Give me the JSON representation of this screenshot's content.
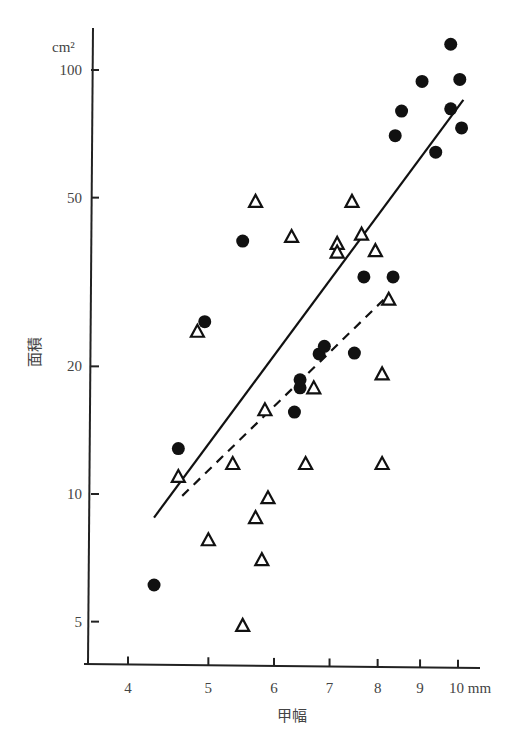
{
  "chart_data": {
    "type": "scatter",
    "title": "",
    "xlabel": "甲幅",
    "ylabel": "面積",
    "x_unit": "mm",
    "y_unit": "cm²",
    "x_scale": "log",
    "y_scale": "log",
    "xlim": [
      3.5,
      11
    ],
    "ylim": [
      4.2,
      130
    ],
    "x_ticks": [
      4,
      5,
      6,
      7,
      8,
      9,
      10
    ],
    "x_tick_labels": [
      "4",
      "5",
      "6",
      "7",
      "8",
      "9",
      "10 mm"
    ],
    "y_ticks": [
      5,
      10,
      20,
      50,
      100
    ],
    "y_tick_labels": [
      "5",
      "10",
      "20",
      "50",
      "100"
    ],
    "grid": false,
    "legend": null,
    "series": [
      {
        "name": "filled-circles",
        "marker": "circle-filled",
        "points": [
          [
            4.3,
            6.1
          ],
          [
            4.6,
            12.8
          ],
          [
            4.95,
            25.5
          ],
          [
            5.5,
            39.5
          ],
          [
            6.35,
            15.6
          ],
          [
            6.45,
            17.8
          ],
          [
            6.45,
            18.6
          ],
          [
            6.8,
            21.4
          ],
          [
            6.9,
            22.3
          ],
          [
            7.5,
            21.5
          ],
          [
            7.7,
            32.5
          ],
          [
            8.35,
            32.5
          ],
          [
            8.4,
            70
          ],
          [
            8.55,
            80
          ],
          [
            9.05,
            94
          ],
          [
            9.4,
            64
          ],
          [
            9.8,
            115
          ],
          [
            9.8,
            81
          ],
          [
            10.05,
            95
          ],
          [
            10.1,
            73
          ]
        ]
      },
      {
        "name": "open-triangles",
        "marker": "triangle-open",
        "points": [
          [
            4.6,
            11
          ],
          [
            4.85,
            24.2
          ],
          [
            5.0,
            7.8
          ],
          [
            5.35,
            11.8
          ],
          [
            5.5,
            4.9
          ],
          [
            5.7,
            49
          ],
          [
            5.7,
            8.8
          ],
          [
            5.8,
            7.0
          ],
          [
            5.85,
            15.8
          ],
          [
            5.9,
            9.8
          ],
          [
            6.3,
            40.5
          ],
          [
            6.55,
            11.8
          ],
          [
            6.7,
            17.8
          ],
          [
            7.15,
            39
          ],
          [
            7.15,
            37.2
          ],
          [
            7.45,
            49
          ],
          [
            7.65,
            41
          ],
          [
            7.95,
            37.5
          ],
          [
            8.1,
            19.2
          ],
          [
            8.1,
            11.8
          ],
          [
            8.25,
            28.8
          ]
        ]
      }
    ],
    "fit_lines": [
      {
        "name": "solid-regression",
        "style": "solid",
        "from": [
          4.3,
          8.8
        ],
        "to": [
          10.15,
          85
        ]
      },
      {
        "name": "dashed-regression",
        "style": "dashed",
        "from": [
          4.65,
          9.9
        ],
        "to": [
          8.25,
          29.5
        ]
      }
    ]
  }
}
